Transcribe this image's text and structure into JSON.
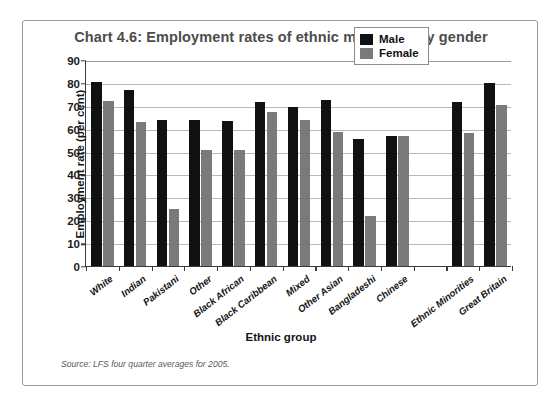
{
  "figure": {
    "title": "Chart 4.6: Employment rates of ethnic minorities by gender",
    "source_note": "Source: LFS four quarter averages for 2005."
  },
  "legend": {
    "position": "top-right",
    "entries": [
      {
        "label": "Male",
        "color": "#111111"
      },
      {
        "label": "Female",
        "color": "#7a7a7a"
      }
    ]
  },
  "chart_data": {
    "type": "bar",
    "title": "Chart 4.6: Employment rates of ethnic minorities by gender",
    "xlabel": "Ethnic group",
    "ylabel": "Employment rate (per cent)",
    "ylim": [
      0,
      90
    ],
    "ytick_step": 10,
    "yticks": [
      0,
      10,
      20,
      30,
      40,
      50,
      60,
      70,
      80,
      90
    ],
    "ytick_labels": [
      "0",
      "10",
      "20",
      "30",
      "40",
      "50",
      "60",
      "70",
      "80",
      "90"
    ],
    "grid": true,
    "legend_position": "upper right",
    "categories": [
      "White",
      "Indian",
      "Pakistani",
      "Other",
      "Black African",
      "Black Caribbean",
      "Mixed",
      "Other Asian",
      "Bangladeshi",
      "Chinese",
      "",
      "Ethnic Minorities",
      "Great Britain"
    ],
    "series": [
      {
        "name": "Male",
        "color": "#111111",
        "values": [
          80.5,
          77.0,
          64.0,
          64.0,
          63.5,
          71.5,
          69.5,
          72.5,
          55.5,
          57.0,
          null,
          71.5,
          80.0
        ]
      },
      {
        "name": "Female",
        "color": "#7a7a7a",
        "values": [
          72.0,
          63.0,
          25.0,
          50.5,
          50.5,
          67.5,
          64.0,
          58.5,
          22.0,
          57.0,
          null,
          58.0,
          70.5
        ]
      }
    ]
  }
}
